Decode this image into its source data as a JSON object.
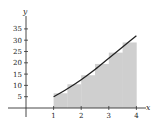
{
  "chart_data": {
    "type": "area",
    "title": "",
    "xlabel": "x",
    "ylabel": "y",
    "xlim": [
      0,
      4.3
    ],
    "ylim": [
      0,
      38
    ],
    "grid": false,
    "x_ticks": [
      1,
      2,
      3,
      4
    ],
    "x_tick_labels": [
      "1",
      "2",
      "3",
      "4"
    ],
    "y_ticks": [
      5,
      10,
      15,
      20,
      25,
      30,
      35
    ],
    "y_tick_labels": [
      "5",
      "10",
      "15",
      "20",
      "25",
      "30",
      "35"
    ],
    "curve": {
      "name": "f(x)",
      "x": [
        1,
        1.5,
        2,
        2.5,
        3,
        3.5,
        4
      ],
      "y": [
        5,
        8.5,
        12.5,
        17,
        22,
        27,
        32
      ]
    },
    "shaded_steps": {
      "name": "step approximation",
      "x_edges": [
        1,
        1.5,
        2,
        2.5,
        3,
        3.5,
        4
      ],
      "heights": [
        6.5,
        10.5,
        14.5,
        19.5,
        24.5,
        29
      ]
    },
    "colors": {
      "curve": "#222222",
      "shade": "#cfcfcf",
      "axis": "#333333"
    }
  },
  "labels": {
    "x_axis": "x",
    "y_axis": "y"
  }
}
